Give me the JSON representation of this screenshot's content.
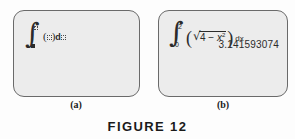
{
  "figure": {
    "caption": "FIGURE  12"
  },
  "panels": [
    {
      "id": "a",
      "label": "(a)",
      "kind": "empty-integral-template",
      "integral": {
        "symbol": "∫",
        "upper_limit": "placeholder-box",
        "lower_limit": "filled-box",
        "integrand": "placeholder-box",
        "differential": "d",
        "variable": "placeholder-box"
      }
    },
    {
      "id": "b",
      "label": "(b)",
      "kind": "evaluated-integral",
      "integral": {
        "symbol": "∫",
        "upper_limit": "2",
        "lower_limit": "0",
        "open_paren": "(",
        "radical_sign": "√",
        "radicand_base": "4 − x",
        "radicand_exponent": "2",
        "close_paren": ")",
        "differential": "dx"
      },
      "result": "3.141593074"
    }
  ],
  "colors": {
    "screen_fill": "#ececec",
    "screen_border": "#6a6a6a",
    "ink": "#2b2b2b",
    "page_background": "#fdfdfd"
  }
}
